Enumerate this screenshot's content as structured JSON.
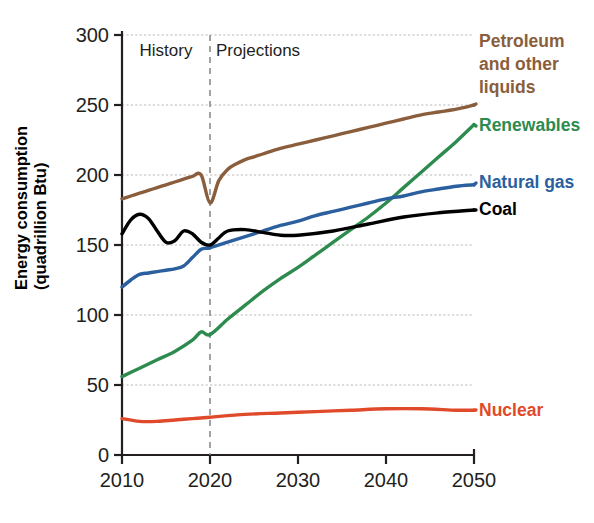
{
  "chart_data": {
    "type": "line",
    "title": "",
    "xlabel": "",
    "ylabel": "Energy consumption (quadrillion Btu)",
    "ylabel_line1": "Energy consumption",
    "ylabel_line2": "(quadrillion Btu)",
    "xlim": [
      2010,
      2050
    ],
    "ylim": [
      0,
      300
    ],
    "grid": true,
    "legend_position": "right-inline",
    "x_ticks": [
      "2010",
      "2020",
      "2030",
      "2040",
      "2050"
    ],
    "x_tick_values": [
      2010,
      2020,
      2030,
      2040,
      2050
    ],
    "y_ticks": [
      "0",
      "50",
      "100",
      "150",
      "200",
      "250",
      "300"
    ],
    "y_tick_values": [
      0,
      50,
      100,
      150,
      200,
      250,
      300
    ],
    "annotations": [
      {
        "name": "history-label",
        "text": "History",
        "x": 2015,
        "y": 285
      },
      {
        "name": "projections-label",
        "text": "Projections",
        "x": 2025,
        "y": 285
      },
      {
        "name": "divider",
        "text": "",
        "x": 2020,
        "y": 0
      }
    ],
    "divider_x": 2020,
    "series": [
      {
        "name": "Petroleum and other liquids",
        "label": "Petroleum and other liquids",
        "color": "#8a5e3c",
        "x": [
          2010,
          2011,
          2012,
          2013,
          2014,
          2015,
          2016,
          2017,
          2018,
          2019,
          2020,
          2021,
          2022,
          2023,
          2024,
          2025,
          2026,
          2028,
          2030,
          2032,
          2034,
          2036,
          2038,
          2040,
          2042,
          2044,
          2046,
          2048,
          2050
        ],
        "values": [
          183,
          185,
          187,
          189,
          191,
          193,
          195,
          197,
          199,
          200,
          180,
          196,
          204,
          208,
          211,
          213,
          215,
          219,
          222,
          225,
          228,
          231,
          234,
          237,
          240,
          243,
          245,
          247,
          250
        ]
      },
      {
        "name": "Renewables",
        "label": "Renewables",
        "color": "#2e8b4f",
        "x": [
          2010,
          2012,
          2014,
          2016,
          2018,
          2019,
          2020,
          2022,
          2024,
          2026,
          2028,
          2030,
          2032,
          2034,
          2036,
          2038,
          2040,
          2042,
          2044,
          2046,
          2048,
          2050
        ],
        "values": [
          56,
          62,
          68,
          74,
          82,
          88,
          86,
          97,
          107,
          117,
          126,
          134,
          143,
          152,
          161,
          170,
          180,
          191,
          202,
          213,
          224,
          236
        ]
      },
      {
        "name": "Natural gas",
        "label": "Natural gas",
        "color": "#2b5f9e",
        "x": [
          2010,
          2011,
          2012,
          2013,
          2014,
          2015,
          2016,
          2017,
          2018,
          2019,
          2020,
          2022,
          2024,
          2026,
          2028,
          2030,
          2032,
          2034,
          2036,
          2038,
          2040,
          2042,
          2044,
          2046,
          2048,
          2050
        ],
        "values": [
          120,
          125,
          129,
          130,
          131,
          132,
          133,
          135,
          141,
          147,
          148,
          152,
          156,
          160,
          164,
          167,
          171,
          174,
          177,
          180,
          183,
          185,
          188,
          190,
          192,
          193
        ]
      },
      {
        "name": "Coal",
        "label": "Coal",
        "color": "#000000",
        "x": [
          2010,
          2011,
          2012,
          2013,
          2014,
          2015,
          2016,
          2017,
          2018,
          2019,
          2020,
          2021,
          2022,
          2024,
          2026,
          2028,
          2030,
          2034,
          2038,
          2042,
          2046,
          2050
        ],
        "values": [
          158,
          168,
          172,
          169,
          160,
          152,
          153,
          160,
          158,
          152,
          150,
          155,
          160,
          161,
          159,
          157,
          157,
          160,
          165,
          170,
          173,
          175
        ]
      },
      {
        "name": "Nuclear",
        "label": "Nuclear",
        "color": "#e04a2a",
        "x": [
          2010,
          2012,
          2014,
          2016,
          2018,
          2020,
          2024,
          2028,
          2032,
          2036,
          2040,
          2044,
          2048,
          2050
        ],
        "values": [
          26,
          24,
          24,
          25,
          26,
          27,
          29,
          30,
          31,
          32,
          33,
          33,
          32,
          32
        ]
      }
    ],
    "labels": [
      {
        "name": "petroleum-label",
        "lines": [
          "Petroleum",
          "and other",
          "liquids"
        ],
        "color": "#8a5e3c"
      },
      {
        "name": "renewables-label",
        "lines": [
          "Renewables"
        ],
        "color": "#2e8b4f"
      },
      {
        "name": "natural-gas-label",
        "lines": [
          "Natural gas"
        ],
        "color": "#2b5f9e"
      },
      {
        "name": "coal-label",
        "lines": [
          "Coal"
        ],
        "color": "#000000"
      },
      {
        "name": "nuclear-label",
        "lines": [
          "Nuclear"
        ],
        "color": "#e04a2a"
      }
    ]
  }
}
